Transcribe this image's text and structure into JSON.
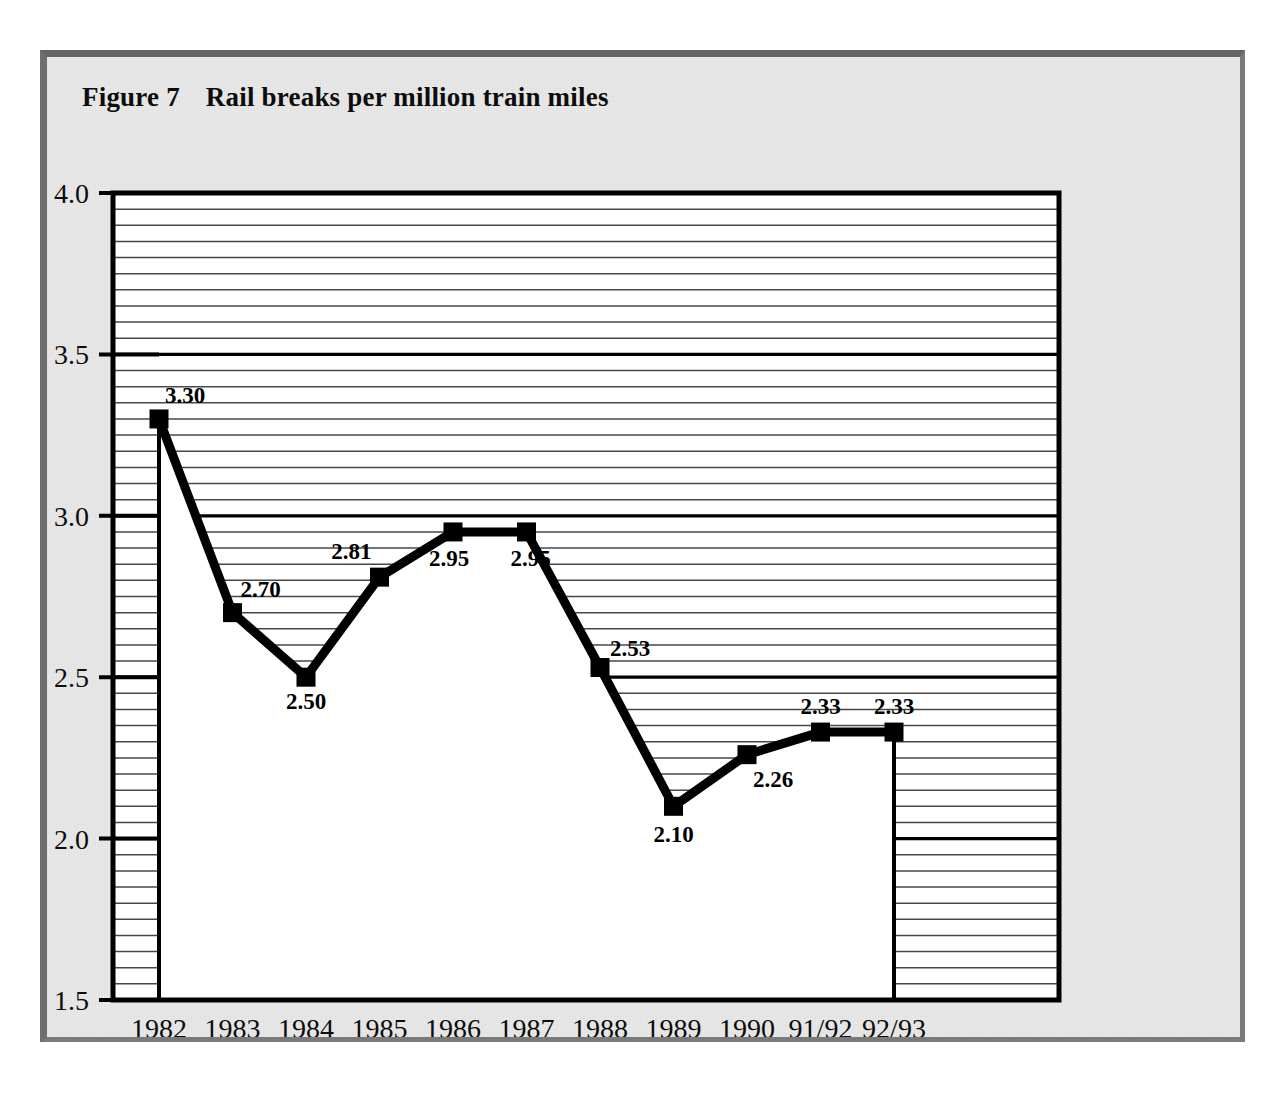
{
  "figure": {
    "label": "Figure 7",
    "title": "Rail breaks per million train miles",
    "frame_color": "#6e6e6e",
    "background_color": "#e9e9e9",
    "plot_background_color": "#ffffff",
    "line_color": "#000000",
    "marker_color": "#000000"
  },
  "chart_data": {
    "type": "line",
    "title": "Rail breaks per million train miles",
    "xlabel": "",
    "ylabel": "",
    "categories": [
      "1982",
      "1983",
      "1984",
      "1985",
      "1986",
      "1987",
      "1988",
      "1989",
      "1990",
      "91/92",
      "92/93"
    ],
    "values": [
      3.3,
      2.7,
      2.5,
      2.81,
      2.95,
      2.95,
      2.53,
      2.1,
      2.26,
      2.33,
      2.33
    ],
    "point_labels": [
      "3.30",
      "2.70",
      "2.50",
      "2.81",
      "2.95",
      "2.95",
      "2.53",
      "2.10",
      "2.26",
      "2.33",
      "2.33"
    ],
    "ylim": [
      1.5,
      4.0
    ],
    "ytick_labels": [
      "1.5",
      "2.0",
      "2.5",
      "3.0",
      "3.5",
      "4.0"
    ],
    "ytick_values": [
      1.5,
      2.0,
      2.5,
      3.0,
      3.5,
      4.0
    ],
    "minor_gridline_step": 0.05,
    "major_gridline_step": 0.5,
    "grid": true,
    "legend": "none",
    "marker": "square"
  }
}
